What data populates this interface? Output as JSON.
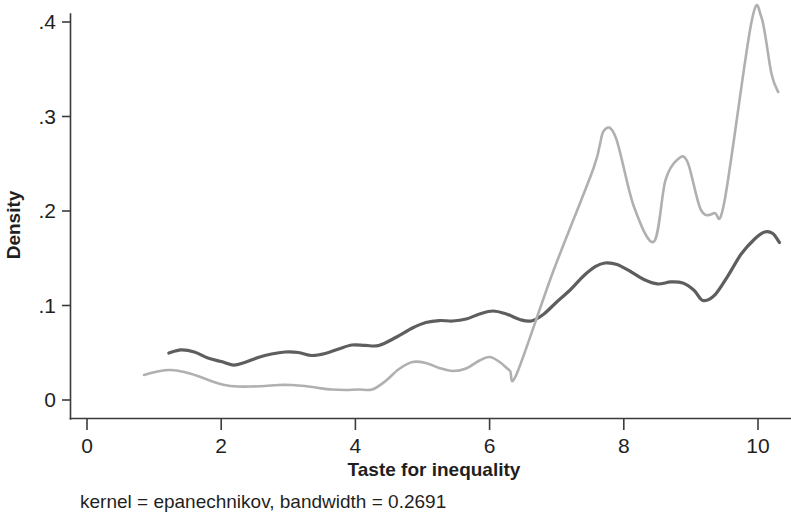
{
  "chart_data": {
    "type": "line",
    "title": "",
    "subtitle": "",
    "xlabel": "Taste for inequality",
    "ylabel": "Density",
    "note": "kernel = epanechnikov, bandwidth = 0.2691",
    "xlim": [
      0,
      10.35
    ],
    "ylim": [
      0,
      0.425
    ],
    "xticks": [
      0,
      2,
      4,
      6,
      8,
      10
    ],
    "xticklabels": [
      "0",
      "2",
      "4",
      "6",
      "8",
      "10"
    ],
    "yticks": [
      0,
      0.1,
      0.2,
      0.3,
      0.4
    ],
    "yticklabels": [
      "0",
      ".1",
      ".2",
      ".3",
      ".4"
    ],
    "grid": false,
    "legend": "none",
    "series": [
      {
        "name": "dark-series",
        "color": "#5e5e5e",
        "width": 3.2,
        "smooth": true,
        "points": [
          [
            1.22,
            0.0497
          ],
          [
            1.4,
            0.053
          ],
          [
            1.6,
            0.0508
          ],
          [
            1.8,
            0.0444
          ],
          [
            2.0,
            0.0407
          ],
          [
            2.18,
            0.037
          ],
          [
            2.35,
            0.0397
          ],
          [
            2.55,
            0.045
          ],
          [
            2.75,
            0.0487
          ],
          [
            2.95,
            0.0508
          ],
          [
            3.15,
            0.0503
          ],
          [
            3.35,
            0.0471
          ],
          [
            3.55,
            0.0492
          ],
          [
            3.75,
            0.054
          ],
          [
            3.95,
            0.0582
          ],
          [
            4.15,
            0.0577
          ],
          [
            4.35,
            0.0577
          ],
          [
            4.6,
            0.0661
          ],
          [
            4.85,
            0.0762
          ],
          [
            5.05,
            0.082
          ],
          [
            5.25,
            0.0841
          ],
          [
            5.45,
            0.0836
          ],
          [
            5.65,
            0.0857
          ],
          [
            5.85,
            0.091
          ],
          [
            6.05,
            0.0942
          ],
          [
            6.25,
            0.091
          ],
          [
            6.45,
            0.0852
          ],
          [
            6.62,
            0.0836
          ],
          [
            6.8,
            0.0905
          ],
          [
            7.0,
            0.1037
          ],
          [
            7.2,
            0.1164
          ],
          [
            7.4,
            0.1312
          ],
          [
            7.58,
            0.1413
          ],
          [
            7.72,
            0.145
          ],
          [
            7.9,
            0.1434
          ],
          [
            8.1,
            0.136
          ],
          [
            8.3,
            0.1275
          ],
          [
            8.5,
            0.1228
          ],
          [
            8.7,
            0.1249
          ],
          [
            8.88,
            0.1238
          ],
          [
            9.05,
            0.1159
          ],
          [
            9.18,
            0.1053
          ],
          [
            9.35,
            0.1106
          ],
          [
            9.55,
            0.1312
          ],
          [
            9.75,
            0.1545
          ],
          [
            9.95,
            0.1704
          ],
          [
            10.1,
            0.1778
          ],
          [
            10.22,
            0.1762
          ],
          [
            10.32,
            0.1667
          ]
        ]
      },
      {
        "name": "light-series",
        "color": "#b0b0b0",
        "width": 2.6,
        "smooth": true,
        "points": [
          [
            0.85,
            0.0265
          ],
          [
            1.05,
            0.0302
          ],
          [
            1.25,
            0.0317
          ],
          [
            1.45,
            0.0296
          ],
          [
            1.65,
            0.0254
          ],
          [
            1.85,
            0.0201
          ],
          [
            2.05,
            0.0159
          ],
          [
            2.25,
            0.0143
          ],
          [
            2.45,
            0.0143
          ],
          [
            2.65,
            0.0148
          ],
          [
            2.85,
            0.0159
          ],
          [
            3.05,
            0.0159
          ],
          [
            3.25,
            0.0148
          ],
          [
            3.45,
            0.0127
          ],
          [
            3.65,
            0.0111
          ],
          [
            3.85,
            0.0106
          ],
          [
            4.05,
            0.0111
          ],
          [
            4.25,
            0.0111
          ],
          [
            4.45,
            0.0201
          ],
          [
            4.65,
            0.0328
          ],
          [
            4.85,
            0.0402
          ],
          [
            5.05,
            0.0392
          ],
          [
            5.25,
            0.0339
          ],
          [
            5.45,
            0.0307
          ],
          [
            5.65,
            0.0333
          ],
          [
            5.85,
            0.0418
          ],
          [
            6.0,
            0.0455
          ],
          [
            6.15,
            0.0402
          ],
          [
            6.3,
            0.0312
          ],
          [
            6.4,
            0.027
          ],
          [
            6.95,
            0.1365
          ],
          [
            7.55,
            0.2455
          ],
          [
            7.7,
            0.2847
          ],
          [
            7.88,
            0.2778
          ],
          [
            8.15,
            0.2048
          ],
          [
            8.45,
            0.1677
          ],
          [
            8.62,
            0.2323
          ],
          [
            8.8,
            0.2545
          ],
          [
            8.95,
            0.2519
          ],
          [
            9.15,
            0.2011
          ],
          [
            9.35,
            0.1978
          ],
          [
            9.5,
            0.2101
          ],
          [
            9.9,
            0.3989
          ],
          [
            10.05,
            0.4053
          ],
          [
            10.2,
            0.3455
          ],
          [
            10.3,
            0.3259
          ]
        ]
      }
    ]
  },
  "axes": {
    "y_tick_labels": [
      ".4",
      ".3",
      ".2",
      ".1",
      "0"
    ],
    "x_tick_labels": [
      "0",
      "2",
      "4",
      "6",
      "8",
      "10"
    ],
    "y_axis_title": "Density",
    "x_axis_title": "Taste for inequality"
  },
  "footnote": {
    "text": "kernel = epanechnikov, bandwidth = 0.2691"
  }
}
